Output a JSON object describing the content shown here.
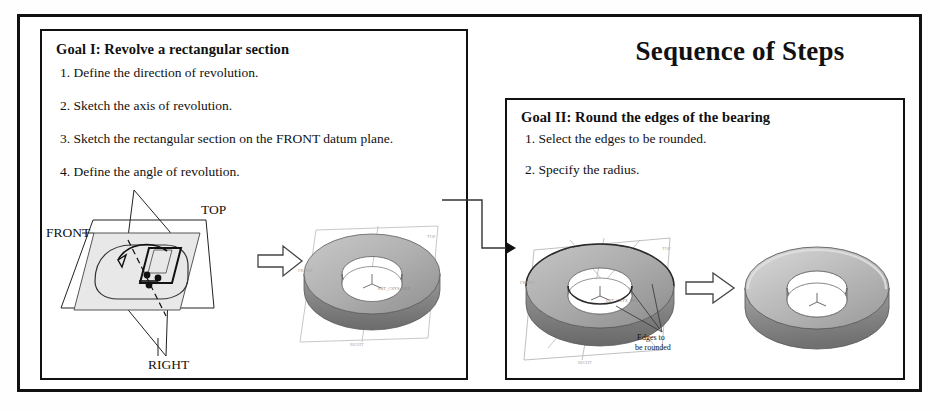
{
  "page": {
    "title": "Sequence of Steps"
  },
  "panels": [
    {
      "id": "goal1",
      "heading": "Goal I: Revolve a rectangular section",
      "steps": [
        "1. Define the direction of revolution.",
        "2. Sketch the axis of revolution.",
        "3. Sketch the rectangular section on the FRONT datum plane.",
        "4. Define the angle of revolution."
      ]
    },
    {
      "id": "goal2",
      "heading": "Goal II: Round the edges of the bearing",
      "steps": [
        "1. Select the edges to be rounded.",
        "2. Specify the radius."
      ]
    }
  ],
  "figures": {
    "datum_planes": {
      "name": "datum-planes-sketch",
      "labels": {
        "top": "TOP",
        "front": "FRONT",
        "right": "RIGHT"
      }
    },
    "revolved_ring": {
      "name": "revolved-ring-model"
    },
    "bearing_edges": {
      "name": "bearing-with-edges-model",
      "annotation_line1": "Edges to",
      "annotation_line2": "be rounded"
    },
    "bearing_rounded": {
      "name": "bearing-rounded-model"
    }
  },
  "arrows": {
    "sketch_to_ring": "block-arrow-right",
    "edges_to_rounded": "block-arrow-right",
    "goal1_to_goal2": "connector-arrow-right"
  },
  "colors": {
    "ink": "#111111",
    "plane_fill": "#e8e8e8",
    "metal_light": "#d4d4d4",
    "metal_mid": "#b3b3b3",
    "metal_dark": "#8f8f8f",
    "metal_darker": "#6f6f6f"
  }
}
